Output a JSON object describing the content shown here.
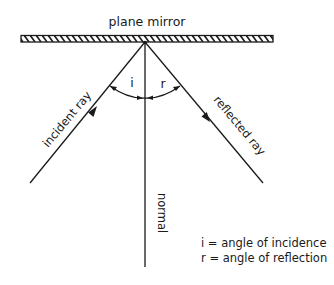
{
  "title": "plane mirror",
  "labels": {
    "incident_ray": "incident ray",
    "reflected_ray": "reflected ray",
    "normal": "normal",
    "angle_i": "i",
    "angle_r": "r"
  },
  "legend": [
    "i = angle of incidence",
    "r = angle of reflection"
  ],
  "colors": {
    "line": "#1a1a1a",
    "background": "#ffffff"
  }
}
